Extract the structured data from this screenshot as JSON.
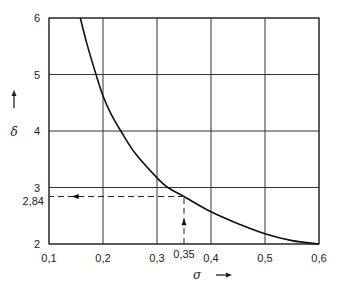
{
  "chart_data": {
    "type": "line",
    "title": "",
    "xlabel": "σ",
    "ylabel": "δ",
    "xlim": [
      0.1,
      0.6
    ],
    "ylim": [
      2,
      6
    ],
    "grid": true,
    "legend": null,
    "x_ticks": [
      0.1,
      0.2,
      0.3,
      0.4,
      0.5,
      0.6
    ],
    "x_tick_labels": [
      "0,1",
      "0,2",
      "0,3",
      "0,4",
      "0,5",
      "0,6"
    ],
    "y_ticks": [
      2,
      3,
      4,
      5,
      6
    ],
    "y_tick_labels": [
      "2",
      "3",
      "4",
      "5",
      "6"
    ],
    "series": [
      {
        "name": "δ(σ)",
        "x": [
          0.158,
          0.17,
          0.187,
          0.2,
          0.215,
          0.233,
          0.26,
          0.3,
          0.32,
          0.35,
          0.4,
          0.45,
          0.5,
          0.55,
          0.6
        ],
        "y": [
          6.0,
          5.55,
          5.0,
          4.62,
          4.3,
          4.0,
          3.6,
          3.17,
          3.0,
          2.84,
          2.57,
          2.36,
          2.18,
          2.06,
          2.0
        ]
      }
    ],
    "annotations": [
      {
        "type": "dashed-guide",
        "from": [
          0.35,
          2
        ],
        "to": [
          0.35,
          2.84
        ],
        "arrow": "up"
      },
      {
        "type": "dashed-guide",
        "from": [
          0.35,
          2.84
        ],
        "to": [
          0.1,
          2.84
        ],
        "arrow": "left"
      },
      {
        "type": "label",
        "text": "0,35",
        "at_x": 0.35
      },
      {
        "type": "label",
        "text": "2,84",
        "at_y": 2.84
      }
    ]
  },
  "labels": {
    "x_axis": "σ",
    "y_axis": "δ",
    "x_marker": "0,35",
    "y_marker": "2,84"
  }
}
